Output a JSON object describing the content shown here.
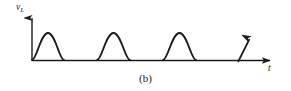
{
  "figure": {
    "caption": "(b)",
    "background_color": "#ffffff",
    "stroke_color": "#1a1a1a",
    "width": 291,
    "height": 91
  },
  "axes": {
    "y_label_symbol": "v",
    "y_label_subscript": "L",
    "y_label_full": "vL",
    "x_label": "t",
    "origin": {
      "x": 32,
      "y": 60
    },
    "y_axis_top": 12,
    "x_axis_right": 276
  },
  "annotations": {
    "continuation_arrow": {
      "name": "break-continuation-arrow",
      "x1": 238,
      "y1": 62,
      "x2": 251,
      "y2": 36
    }
  },
  "chart_data": {
    "type": "line",
    "title": "(b)",
    "xlabel": "t",
    "ylabel": "vL",
    "grid": false,
    "legend": null,
    "xlim": [
      0,
      6
    ],
    "ylim": [
      0,
      1.15
    ],
    "baseline": 0,
    "peak_value": 1,
    "pulses": [
      {
        "index": 1,
        "x_start": 0.0,
        "x_peak": 0.5,
        "x_end": 1.0,
        "peak": 1
      },
      {
        "index": 2,
        "x_start": 2.0,
        "x_peak": 2.5,
        "x_end": 3.0,
        "peak": 1
      },
      {
        "index": 3,
        "x_start": 4.0,
        "x_peak": 4.5,
        "x_end": 5.0,
        "peak": 1
      }
    ],
    "pulses_px": [
      {
        "index": 1,
        "x_start": 32,
        "x_peak": 48,
        "x_end": 64,
        "y_peak": 33,
        "y_base": 60
      },
      {
        "index": 2,
        "x_start": 97,
        "x_peak": 113.5,
        "x_end": 130,
        "y_peak": 33,
        "y_base": 60
      },
      {
        "index": 3,
        "x_start": 163,
        "x_peak": 179.5,
        "x_end": 196,
        "y_peak": 33,
        "y_base": 60
      }
    ],
    "series": [
      {
        "name": "vL",
        "x": [
          0.0,
          0.125,
          0.25,
          0.375,
          0.5,
          0.625,
          0.75,
          0.875,
          1.0,
          1.5,
          2.0,
          2.125,
          2.25,
          2.375,
          2.5,
          2.625,
          2.75,
          2.875,
          3.0,
          3.5,
          4.0,
          4.125,
          4.25,
          4.375,
          4.5,
          4.625,
          4.75,
          4.875,
          5.0,
          5.5,
          6.0
        ],
        "values": [
          0,
          0.383,
          0.707,
          0.924,
          1.0,
          0.924,
          0.707,
          0.383,
          0,
          0,
          0,
          0.383,
          0.707,
          0.924,
          1.0,
          0.924,
          0.707,
          0.383,
          0,
          0,
          0,
          0.383,
          0.707,
          0.924,
          1.0,
          0.924,
          0.707,
          0.383,
          0,
          0,
          0
        ]
      }
    ]
  }
}
